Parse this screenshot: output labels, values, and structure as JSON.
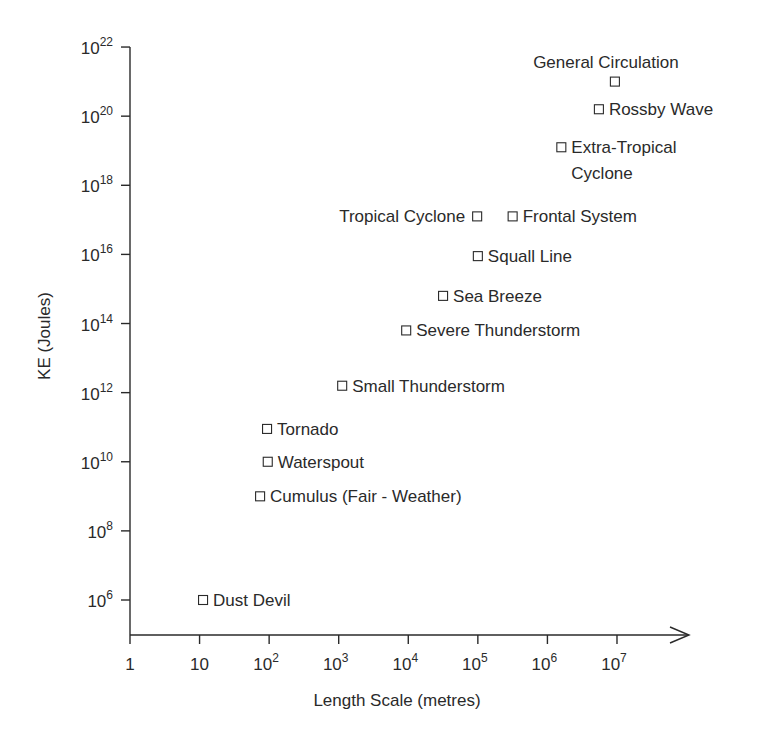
{
  "chart_data": {
    "type": "scatter",
    "title": "",
    "xlabel": "Length Scale (metres)",
    "ylabel": "KE (Joules)",
    "x_scale": "log",
    "y_scale": "log",
    "xlim_exp": [
      0,
      7
    ],
    "ylim_exp": [
      6,
      22
    ],
    "grid": false,
    "legend": "none",
    "marker": "open-square",
    "x_ticks": [
      {
        "exp": 0,
        "base": "1",
        "sup": ""
      },
      {
        "exp": 1,
        "base": "10",
        "sup": ""
      },
      {
        "exp": 2,
        "base": "10",
        "sup": "2"
      },
      {
        "exp": 3,
        "base": "10",
        "sup": "3"
      },
      {
        "exp": 4,
        "base": "10",
        "sup": "4"
      },
      {
        "exp": 5,
        "base": "10",
        "sup": "5"
      },
      {
        "exp": 6,
        "base": "10",
        "sup": "6"
      },
      {
        "exp": 7,
        "base": "10",
        "sup": "7"
      }
    ],
    "y_ticks": [
      {
        "exp": 6,
        "base": "10",
        "sup": "6"
      },
      {
        "exp": 8,
        "base": "10",
        "sup": "8"
      },
      {
        "exp": 10,
        "base": "10",
        "sup": "10"
      },
      {
        "exp": 12,
        "base": "10",
        "sup": "12"
      },
      {
        "exp": 14,
        "base": "10",
        "sup": "14"
      },
      {
        "exp": 16,
        "base": "10",
        "sup": "16"
      },
      {
        "exp": 18,
        "base": "10",
        "sup": "18"
      },
      {
        "exp": 20,
        "base": "10",
        "sup": "20"
      },
      {
        "exp": 22,
        "base": "10",
        "sup": "22"
      }
    ],
    "points": [
      {
        "name": "Dust Devil",
        "log_x": 1.05,
        "log_y": 6.0,
        "label_pos": "right",
        "lines": [
          "Dust Devil"
        ]
      },
      {
        "name": "Cumulus (Fair - Weather)",
        "log_x": 1.87,
        "log_y": 9.0,
        "label_pos": "right",
        "lines": [
          "Cumulus (Fair - Weather)"
        ]
      },
      {
        "name": "Waterspout",
        "log_x": 1.98,
        "log_y": 10.0,
        "label_pos": "right",
        "lines": [
          "Waterspout"
        ]
      },
      {
        "name": "Tornado",
        "log_x": 1.97,
        "log_y": 10.95,
        "label_pos": "right",
        "lines": [
          "Tornado"
        ]
      },
      {
        "name": "Small Thunderstorm",
        "log_x": 3.05,
        "log_y": 12.2,
        "label_pos": "right",
        "lines": [
          "Small Thunderstorm"
        ]
      },
      {
        "name": "Severe Thunderstorm",
        "log_x": 3.97,
        "log_y": 13.8,
        "label_pos": "right",
        "lines": [
          "Severe Thunderstorm"
        ]
      },
      {
        "name": "Sea Breeze",
        "log_x": 4.5,
        "log_y": 14.8,
        "label_pos": "right",
        "lines": [
          "Sea Breeze"
        ]
      },
      {
        "name": "Squall Line",
        "log_x": 5.0,
        "log_y": 15.95,
        "label_pos": "right",
        "lines": [
          "Squall Line"
        ]
      },
      {
        "name": "Tropical Cyclone",
        "log_x": 4.99,
        "log_y": 17.1,
        "label_pos": "left",
        "lines": [
          "Tropical Cyclone"
        ]
      },
      {
        "name": "Frontal System",
        "log_x": 5.5,
        "log_y": 17.1,
        "label_pos": "right",
        "lines": [
          "Frontal System"
        ]
      },
      {
        "name": "Extra-Tropical Cyclone",
        "log_x": 6.2,
        "log_y": 19.1,
        "label_pos": "right",
        "lines": [
          "Extra-Tropical",
          "Cyclone"
        ]
      },
      {
        "name": "Rossby Wave",
        "log_x": 6.74,
        "log_y": 20.2,
        "label_pos": "right",
        "lines": [
          "Rossby Wave"
        ]
      },
      {
        "name": "General Circulation",
        "log_x": 6.97,
        "log_y": 21.0,
        "label_pos": "above",
        "lines": [
          "General Circulation"
        ]
      }
    ]
  },
  "colors": {
    "ink": "#2a2a2a",
    "background": "#ffffff"
  }
}
